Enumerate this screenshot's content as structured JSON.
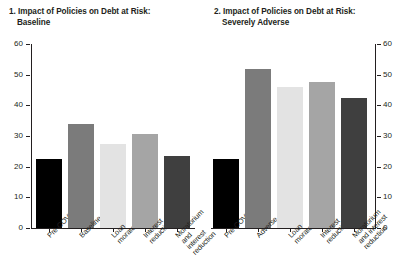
{
  "chart_data": [
    {
      "type": "bar",
      "panel_number": "1.",
      "title": "Impact of Policies on Debt at Risk:",
      "subtitle": "Baseline",
      "categories": [
        "Pre-COVID",
        "Baseline",
        "Loan\nmoratorium",
        "Interest\nreduction",
        "Moratorium\nand interest\nreduction"
      ],
      "values": [
        22.5,
        34.0,
        27.5,
        30.5,
        23.5
      ],
      "colors": [
        "#000000",
        "#7b7b7b",
        "#e3e3e3",
        "#a5a5a5",
        "#3f3f3f"
      ],
      "xlabel": "",
      "ylabel": "",
      "ylim": [
        0,
        60
      ],
      "yticks": [
        0,
        10,
        20,
        30,
        40,
        50,
        60
      ],
      "ytick_labels": [
        "0",
        "10",
        "20",
        "30",
        "40",
        "50",
        "60"
      ],
      "axis_side": "left",
      "grid": false,
      "legend": "none"
    },
    {
      "type": "bar",
      "panel_number": "2.",
      "title": "Impact of Policies on Debt at Risk:",
      "subtitle": "Severely Adverse",
      "categories": [
        "Pre-COVID",
        "Adverse",
        "Loan\nmoratorium",
        "Interest\nreduction",
        "Moratorium\nand interest\nreduction"
      ],
      "values": [
        22.5,
        52.0,
        46.0,
        47.5,
        42.5
      ],
      "colors": [
        "#000000",
        "#7b7b7b",
        "#e3e3e3",
        "#a5a5a5",
        "#3f3f3f"
      ],
      "xlabel": "",
      "ylabel": "",
      "ylim": [
        0,
        60
      ],
      "yticks": [
        0,
        10,
        20,
        30,
        40,
        50,
        60
      ],
      "ytick_labels": [
        "0",
        "10",
        "20",
        "30",
        "40",
        "50",
        "60"
      ],
      "axis_side": "right",
      "grid": false,
      "legend": "none"
    }
  ]
}
